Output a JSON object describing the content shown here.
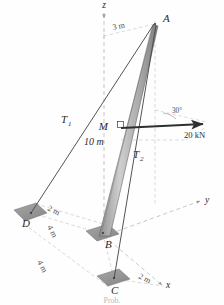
{
  "figure": {
    "kind": "statics-free-body-diagram",
    "caption": "Prob.",
    "background_color": "#fefefe",
    "ink_color": "#3a3a3a",
    "plate_fill": "#9a9a9a",
    "mast_fill": "#b4b4b4"
  },
  "axes": [
    {
      "id": "z",
      "label": "z",
      "x": 104,
      "y": 8
    },
    {
      "id": "y",
      "label": "y",
      "x": 205,
      "y": 203
    },
    {
      "id": "x",
      "label": "x",
      "x": 166,
      "y": 288
    }
  ],
  "points": [
    {
      "id": "A",
      "label": "A",
      "px": 155,
      "py": 22,
      "lx": 163,
      "ly": 22
    },
    {
      "id": "M",
      "label": "M",
      "px": 120,
      "py": 128,
      "lx": 108,
      "ly": 130
    },
    {
      "id": "B",
      "label": "B",
      "px": 103,
      "py": 234,
      "lx": 105,
      "ly": 248
    },
    {
      "id": "C",
      "label": "C",
      "px": 114,
      "py": 279,
      "lx": 111,
      "ly": 294
    },
    {
      "id": "D",
      "label": "D",
      "px": 31,
      "py": 213,
      "lx": 22,
      "ly": 227
    }
  ],
  "cables": [
    {
      "id": "T1",
      "label": "T",
      "subscript": "1",
      "from": "A",
      "to": "D",
      "lx": 61,
      "ly": 123
    },
    {
      "id": "T2",
      "label": "T",
      "subscript": "2",
      "from": "A",
      "to": "C",
      "lx": 133,
      "ly": 158
    }
  ],
  "members": [
    {
      "id": "mast",
      "label": "mast-AB",
      "from": "A",
      "to": "B"
    }
  ],
  "dimensions": [
    {
      "id": "dim-3m",
      "value": "3 m",
      "lx": 113,
      "ly": 30,
      "rotate": -11
    },
    {
      "id": "dim-10m",
      "value": "10 m",
      "lx": 84,
      "ly": 145
    },
    {
      "id": "dim-2m-D",
      "value": "2 m",
      "lx": 47,
      "ly": 210,
      "rotate": 26
    },
    {
      "id": "dim-4m-DB",
      "value": "4 m",
      "lx": 47,
      "ly": 227,
      "rotate": 62
    },
    {
      "id": "dim-4m-BC",
      "value": "4 m",
      "lx": 37,
      "ly": 262,
      "rotate": 62
    },
    {
      "id": "dim-2m-C",
      "value": "2 m",
      "lx": 138,
      "ly": 278,
      "rotate": 26
    }
  ],
  "force": {
    "id": "applied-load",
    "magnitude_label": "20 kN",
    "angle_label": "30°",
    "label_x": 184,
    "label_y": 138,
    "angle_x": 172,
    "angle_y": 113,
    "tail_x": 121,
    "tail_y": 128,
    "tip_x": 206,
    "tip_y": 124
  },
  "right_angle_marker": {
    "id": "right-angle-at-M",
    "x": 121,
    "y": 124
  }
}
